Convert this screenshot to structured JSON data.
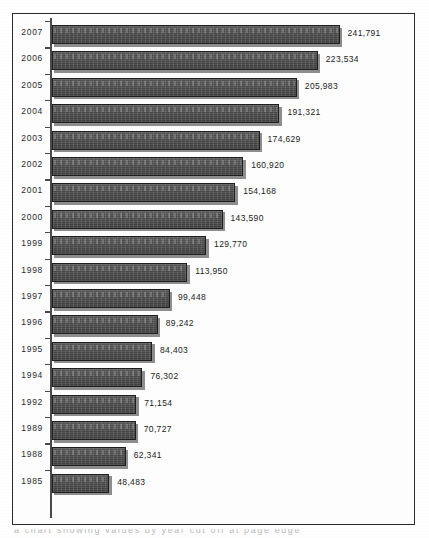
{
  "chart_data": {
    "type": "bar",
    "orientation": "horizontal",
    "title": "",
    "subtitle": "",
    "xlabel": "",
    "ylabel": "",
    "grid": false,
    "legend": null,
    "axis": {
      "category_axis": "y",
      "value_axis": "x",
      "value_axis_visible": false,
      "ticks_visible": true,
      "xlim": [
        0,
        241791
      ]
    },
    "categories": [
      "2007",
      "2006",
      "2005",
      "2004",
      "2003",
      "2002",
      "2001",
      "2000",
      "1999",
      "1998",
      "1997",
      "1996",
      "1995",
      "1994",
      "1992",
      "1989",
      "1988",
      "1985"
    ],
    "values": [
      241791,
      223534,
      205983,
      191321,
      174629,
      160920,
      154168,
      143590,
      129770,
      113950,
      99448,
      89242,
      84403,
      76302,
      71154,
      70727,
      62341,
      48483
    ],
    "value_labels": [
      "241,791",
      "223,534",
      "205,983",
      "191,321",
      "174,629",
      "160,920",
      "154,168",
      "143,590",
      "129,770",
      "113,950",
      "99,448",
      "89,242",
      "84,403",
      "76,302",
      "71,154",
      "70,727",
      "62,341",
      "48,483"
    ],
    "bar_color": "#4a4a4a",
    "bar_border_color": "#1e1e1e",
    "bar_shadow_color": "#8d8d8d",
    "frame_color": "#2b2b2b",
    "axis_color": "#4a4a4a",
    "label_color": "#2a2a2a",
    "background_color": "#fdfdfd"
  },
  "caption": {
    "clipped_text": "a chart showing values by year cut off at page edge"
  }
}
